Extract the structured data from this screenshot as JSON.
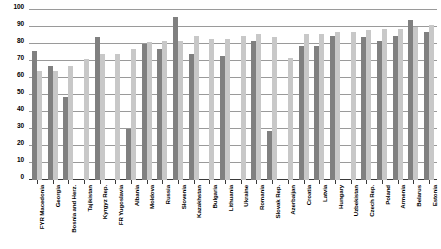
{
  "chart_data": {
    "type": "bar",
    "title": "",
    "subtitle": "",
    "xlabel": "",
    "ylabel": "",
    "ylim": [
      0,
      100
    ],
    "ytick_step": 10,
    "yticks": [
      0,
      10,
      20,
      30,
      40,
      50,
      60,
      70,
      80,
      90,
      100
    ],
    "grid": true,
    "legend": "none",
    "orientation": "vertical",
    "grouping": "grouped",
    "categories": [
      "FYR Macedonia",
      "Georgia",
      "Bosnia and Herz.",
      "Tajikistan",
      "Kyrgyz Rep.",
      "FR Yugoslavia",
      "Albania",
      "Moldova",
      "Russia",
      "Slovenia",
      "Kazakhstan",
      "Bulgaria",
      "Lithuania",
      "Ukraine",
      "Romania",
      "Slovak Rep.",
      "Azerbaijan",
      "Croatia",
      "Latvia",
      "Hungary",
      "Uzbekistan",
      "Czech Rep.",
      "Poland",
      "Armenia",
      "Belarus",
      "Estonia"
    ],
    "series": [
      {
        "name": "Series 1",
        "color": "#808080",
        "values": [
          76,
          67,
          49,
          0,
          84,
          0,
          30,
          80,
          77,
          96,
          74,
          0,
          73,
          0,
          82,
          29,
          0,
          79,
          79,
          85,
          0,
          84,
          82,
          85,
          94,
          87
        ]
      },
      {
        "name": "Series 2",
        "color": "#c8c8c8",
        "values": [
          64,
          64,
          67,
          71,
          74,
          74,
          77,
          81,
          82,
          82,
          85,
          83,
          83,
          85,
          86,
          84,
          72,
          86,
          86,
          87,
          87,
          88,
          89,
          89,
          90,
          91
        ]
      }
    ]
  }
}
